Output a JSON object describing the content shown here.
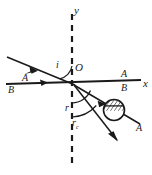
{
  "figure": {
    "type": "optics-ray-diagram",
    "colors": {
      "ink": "#1a1a1a",
      "background": "#ffffff",
      "hatch": "#2b2b2b"
    },
    "axes": {
      "y_label": "y",
      "x_label": "x",
      "origin_label": "O",
      "y_style": "dashed-vertical",
      "x_style": "solid-horizontal"
    },
    "angles": [
      {
        "name": "incidence",
        "label": "i",
        "arc": "between y-axis and incident ray"
      },
      {
        "name": "refraction",
        "label": "r",
        "arc": "between downward normal and first refracted ray"
      },
      {
        "name": "critical-refraction",
        "label": "r",
        "subscript": "c",
        "arc": "between downward normal and second refracted ray"
      }
    ],
    "rays": [
      {
        "name": "incident-ray",
        "label_top": "A",
        "label_bottom": "B",
        "direction": "down-right toward origin"
      },
      {
        "name": "incident-axis-ray",
        "label_top": "A",
        "label_bottom": "B",
        "direction": "right along x-axis"
      },
      {
        "name": "refracted-ray-1",
        "label_end": "A",
        "direction": "down-right shallow"
      },
      {
        "name": "refracted-ray-2",
        "direction": "down-right steep"
      }
    ],
    "labels": {
      "y": "y",
      "x": "x",
      "O": "O",
      "i": "i",
      "A_left": "A",
      "B_left": "B",
      "A_right": "A",
      "B_right": "B",
      "r": "r",
      "rc_base": "r",
      "rc_sub": "c",
      "A_end": "A"
    },
    "polarization_marker": {
      "name": "hatched-circle",
      "shape": "circle with diagonal hatching in upper half",
      "position": "on refracted-ray-1"
    }
  }
}
